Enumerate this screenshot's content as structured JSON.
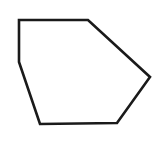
{
  "figure": {
    "shape": "pentagon",
    "stroke_color": "#1a1a1a",
    "fill_color": "#ffffff",
    "stroke_width": 2.6,
    "points": "19,20 88,20 150,77 117,123 40,124 19,62"
  }
}
